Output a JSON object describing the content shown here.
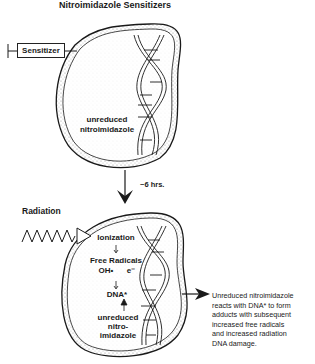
{
  "title": "Nitroimidazole Sensitizers",
  "top_cell": {
    "syringe_label": "Sensitizer",
    "label_line1": "unreduced",
    "label_line2": "nitroimidazole"
  },
  "transition": {
    "arrow_icon": "down-arrow-icon",
    "time_label": "~6 hrs."
  },
  "bottom_cell": {
    "radiation_label": "Radiation",
    "steps": [
      "Ionization",
      "Free Radicals",
      "DNA*"
    ],
    "radicals": [
      "OH•",
      "e⁻"
    ],
    "small_arrow": "↓",
    "sensitizer_lines": [
      "unreduced",
      "nitro-",
      "imidazole"
    ]
  },
  "outcome": {
    "lines": [
      "Unreduced nitroimidazole",
      "reacts with DNA* to form",
      "adducts with subsequent",
      "increased free radicals",
      "and increased radiation",
      "DNA damage."
    ]
  },
  "colors": {
    "ink": "#1a1a1a",
    "stipple": "#9a9a9a",
    "background": "#ffffff"
  }
}
